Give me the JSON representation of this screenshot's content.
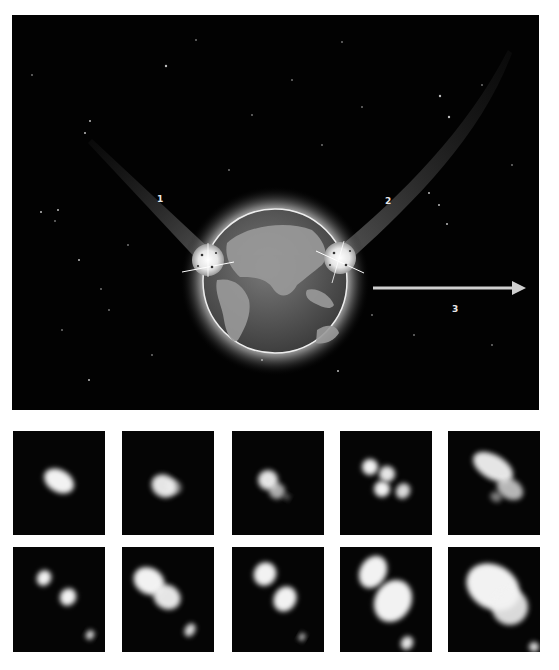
{
  "figure": {
    "top_panel": {
      "background": "#020202",
      "earth": {
        "cx": 263,
        "cy": 266,
        "r": 72
      },
      "satellites": [
        {
          "name": "satellite-left",
          "cx": 196,
          "cy": 245,
          "r": 16
        },
        {
          "name": "satellite-right",
          "cx": 328,
          "cy": 243,
          "r": 16
        }
      ],
      "labels": [
        {
          "id": "1",
          "text": "1",
          "x": 145,
          "y": 180
        },
        {
          "id": "2",
          "text": "2",
          "x": 373,
          "y": 182
        },
        {
          "id": "3",
          "text": "3",
          "x": 440,
          "y": 290
        }
      ],
      "arrow": {
        "x1": 361,
        "x2": 514,
        "y": 273,
        "color": "#d0d0d0"
      }
    },
    "thumbnails": [
      {
        "x": 13,
        "y": 431,
        "blobs": [
          [
            46,
            50,
            16,
            11,
            1.0
          ]
        ]
      },
      {
        "x": 122,
        "y": 431,
        "blobs": [
          [
            42,
            55,
            13,
            11,
            0.95
          ],
          [
            52,
            56,
            8,
            7,
            0.5
          ]
        ]
      },
      {
        "x": 232,
        "y": 431,
        "blobs": [
          [
            36,
            49,
            10,
            10,
            0.95
          ],
          [
            45,
            60,
            8,
            8,
            0.7
          ],
          [
            55,
            66,
            3,
            3,
            0.4
          ]
        ]
      },
      {
        "x": 340,
        "y": 431,
        "blobs": [
          [
            30,
            36,
            8,
            8,
            1.0
          ],
          [
            47,
            43,
            8,
            8,
            0.95
          ],
          [
            42,
            58,
            8,
            8,
            1.0
          ],
          [
            63,
            60,
            7,
            8,
            0.9
          ]
        ]
      },
      {
        "x": 448,
        "y": 431,
        "blobs": [
          [
            45,
            36,
            22,
            12,
            0.95
          ],
          [
            62,
            58,
            14,
            10,
            0.75
          ],
          [
            48,
            66,
            6,
            5,
            0.5
          ]
        ]
      },
      {
        "x": 13,
        "y": 547,
        "blobs": [
          [
            31,
            31,
            7,
            8,
            1.0
          ],
          [
            55,
            50,
            8,
            9,
            1.0
          ],
          [
            77,
            88,
            4,
            5,
            0.9
          ]
        ]
      },
      {
        "x": 122,
        "y": 547,
        "blobs": [
          [
            27,
            34,
            16,
            13,
            1.0
          ],
          [
            45,
            50,
            14,
            12,
            0.95
          ],
          [
            68,
            83,
            5,
            7,
            0.9
          ]
        ]
      },
      {
        "x": 232,
        "y": 547,
        "blobs": [
          [
            33,
            27,
            11,
            12,
            1.0
          ],
          [
            53,
            52,
            11,
            13,
            1.0
          ],
          [
            70,
            90,
            3,
            4,
            0.8
          ]
        ]
      },
      {
        "x": 340,
        "y": 547,
        "blobs": [
          [
            33,
            25,
            13,
            17,
            1.0
          ],
          [
            53,
            54,
            18,
            22,
            1.0
          ],
          [
            67,
            96,
            6,
            7,
            0.95
          ]
        ]
      },
      {
        "x": 448,
        "y": 547,
        "blobs": [
          [
            45,
            40,
            28,
            22,
            1.0
          ],
          [
            62,
            60,
            18,
            18,
            0.9
          ],
          [
            86,
            100,
            5,
            5,
            0.9
          ]
        ]
      }
    ]
  }
}
